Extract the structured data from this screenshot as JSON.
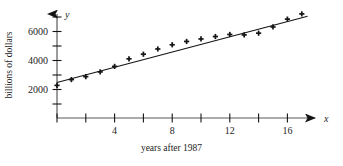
{
  "chart_data": {
    "type": "scatter",
    "title": "",
    "subtitle": "",
    "xlabel": "years after 1987",
    "ylabel": "billions of dollars",
    "x_axis_variable": "x",
    "y_axis_variable": "y",
    "xlim": [
      0,
      17.8
    ],
    "ylim": [
      0,
      7600
    ],
    "grid": false,
    "legend": null,
    "x_ticks": [
      0,
      2,
      4,
      6,
      8,
      10,
      12,
      14,
      16
    ],
    "x_tick_labels": [
      "",
      "",
      "4",
      "",
      "8",
      "",
      "12",
      "",
      "16"
    ],
    "y_ticks": [
      1000,
      2000,
      3000,
      4000,
      5000,
      6000,
      7000
    ],
    "y_tick_labels": [
      "",
      "2000",
      "",
      "4000",
      "",
      "6000",
      ""
    ],
    "marker": "plus",
    "marker_color": "#141414",
    "line_color": "#141414",
    "points": [
      {
        "x": 0,
        "y": 2250
      },
      {
        "x": 1,
        "y": 2650
      },
      {
        "x": 2,
        "y": 2850
      },
      {
        "x": 3,
        "y": 3180
      },
      {
        "x": 4,
        "y": 3560
      },
      {
        "x": 5,
        "y": 4080
      },
      {
        "x": 6,
        "y": 4400
      },
      {
        "x": 7,
        "y": 4760
      },
      {
        "x": 8,
        "y": 5050
      },
      {
        "x": 9,
        "y": 5280
      },
      {
        "x": 10,
        "y": 5450
      },
      {
        "x": 11,
        "y": 5620
      },
      {
        "x": 12,
        "y": 5760
      },
      {
        "x": 13,
        "y": 5730
      },
      {
        "x": 14,
        "y": 5850
      },
      {
        "x": 15,
        "y": 6280
      },
      {
        "x": 16,
        "y": 6820
      },
      {
        "x": 17,
        "y": 7180
      }
    ],
    "trend_line": {
      "type": "line",
      "x_start": 0,
      "y_start": 2450,
      "x_end": 17.4,
      "y_end": 7020
    }
  }
}
